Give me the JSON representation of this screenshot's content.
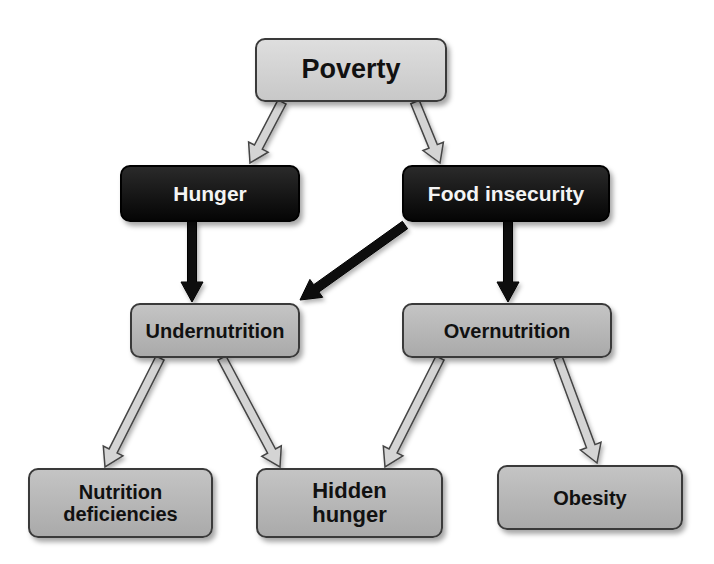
{
  "diagram": {
    "nodes": {
      "poverty": "Poverty",
      "hunger": "Hunger",
      "food_insecurity": "Food insecurity",
      "undernutrition": "Undernutrition",
      "overnutrition": "Overnutrition",
      "nutrition_deficiencies": "Nutrition\ndeficiencies",
      "hidden_hunger": "Hidden\nhunger",
      "obesity": "Obesity"
    },
    "edges": [
      {
        "from": "poverty",
        "to": "hunger",
        "style": "hollow"
      },
      {
        "from": "poverty",
        "to": "food_insecurity",
        "style": "hollow"
      },
      {
        "from": "hunger",
        "to": "undernutrition",
        "style": "solid"
      },
      {
        "from": "food_insecurity",
        "to": "undernutrition",
        "style": "solid"
      },
      {
        "from": "food_insecurity",
        "to": "overnutrition",
        "style": "solid"
      },
      {
        "from": "undernutrition",
        "to": "nutrition_deficiencies",
        "style": "hollow"
      },
      {
        "from": "undernutrition",
        "to": "hidden_hunger",
        "style": "hollow"
      },
      {
        "from": "overnutrition",
        "to": "hidden_hunger",
        "style": "hollow"
      },
      {
        "from": "overnutrition",
        "to": "obesity",
        "style": "hollow"
      }
    ]
  }
}
